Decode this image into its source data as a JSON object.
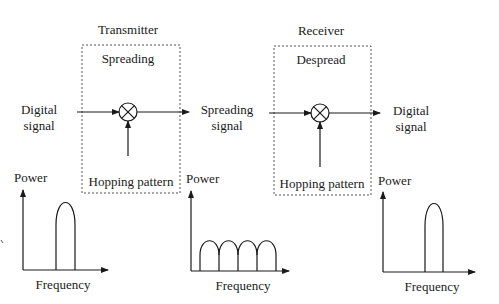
{
  "transmitter": {
    "title": "Transmitter",
    "block_label": "Spreading",
    "control_label": "Hopping pattern"
  },
  "receiver": {
    "title": "Receiver",
    "block_label": "Despread",
    "control_label": "Hopping pattern"
  },
  "signals": {
    "input_line1": "Digital",
    "input_line2": "signal",
    "middle_line1": "Spreading",
    "middle_line2": "signal",
    "output_line1": "Digital",
    "output_line2": "signal"
  },
  "spectra": [
    {
      "y_label": "Power",
      "x_label": "Frequency",
      "shape": "narrowband single lobe"
    },
    {
      "y_label": "Power",
      "x_label": "Frequency",
      "shape": "spread four lobes"
    },
    {
      "y_label": "Power",
      "x_label": "Frequency",
      "shape": "narrowband single lobe"
    }
  ],
  "colors": {
    "stroke": "#1a1a1a",
    "dashed_box": "#555555",
    "background": "#ffffff"
  }
}
